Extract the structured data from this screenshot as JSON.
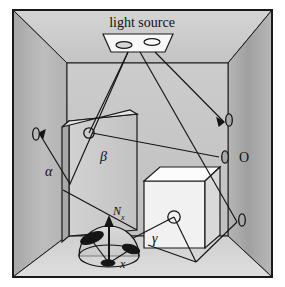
{
  "figure": {
    "kind": "diagram",
    "title_label": "light source",
    "frame": {
      "border_color": "#1a1a1a",
      "background": "#ffffff"
    },
    "colors": {
      "left_wall": "#b9b9b9",
      "right_wall": "#a9a9a9",
      "back_wall": "#c6c6c6",
      "ceiling": "#cecece",
      "floor": "#d8d8d8",
      "panel_front": "#c9c9c9",
      "panel_side": "#b0b0b0",
      "cube_front": "#f2f2f2",
      "cube_top": "#fbfbfb",
      "cube_side": "#dcdcdc",
      "hemisphere": "#cfcfcf",
      "patch_dark": "#1d1d1d",
      "ray": "#141414",
      "outline": "#1a1a1a",
      "light_panel": "#f7f7f7"
    }
  },
  "labels": {
    "light_source": "light source",
    "alpha": "α",
    "beta": "β",
    "gamma": "γ",
    "normal": "N",
    "normal_sub": "x",
    "point_x": "x",
    "eye_right": "O"
  },
  "elements": {
    "light_source_panel": {
      "name": "light source",
      "lamp_count": 2
    },
    "objects": [
      {
        "name": "tall-panel",
        "label": "β"
      },
      {
        "name": "cube",
        "label": "γ"
      }
    ],
    "eyes": [
      {
        "name": "eye-left-wall",
        "label": ""
      },
      {
        "name": "eye-right-upper",
        "label": ""
      },
      {
        "name": "eye-right-middle",
        "label": "O"
      },
      {
        "name": "eye-right-lower",
        "label": ""
      }
    ],
    "hemisphere": {
      "name": "shading-hemisphere",
      "surface_point": "x",
      "normal": "N_x",
      "patches": 3
    }
  }
}
